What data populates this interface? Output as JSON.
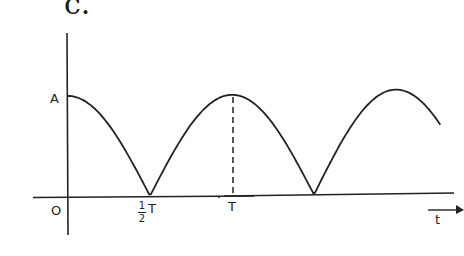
{
  "panel_label": "c.",
  "labels": {
    "amplitude": "A",
    "origin": "O",
    "half_period_num": "1",
    "half_period_den": "2",
    "half_period_T": "T",
    "period": "T",
    "time_axis": "t"
  },
  "chart_data": {
    "type": "line",
    "title": "c.",
    "xlabel": "t",
    "ylabel": "",
    "x_ticks": [
      "O",
      "1/2 T",
      "T"
    ],
    "y_ticks": [
      "A"
    ],
    "x": [
      0,
      0.25,
      0.5,
      0.75,
      1.0,
      1.25,
      1.5,
      1.75,
      2.0,
      2.25
    ],
    "x_units": "T",
    "values": [
      1.0,
      0.707,
      0.0,
      0.707,
      1.0,
      0.707,
      0.0,
      0.707,
      1.0,
      0.707
    ],
    "y_units": "A",
    "annotations": [
      "dashed vertical line from peak at t=T down to t-axis"
    ],
    "grid": false,
    "legend": null
  },
  "colors": {
    "ink": "#222222",
    "background": "#ffffff"
  }
}
